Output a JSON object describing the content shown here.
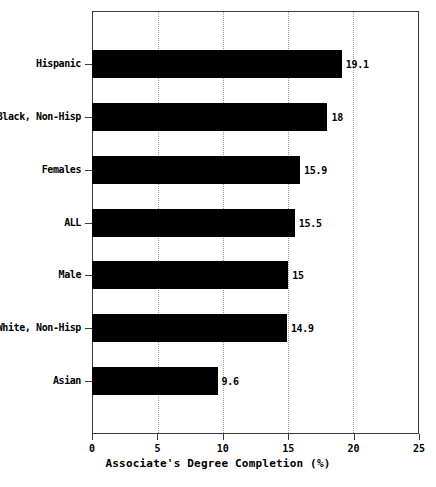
{
  "chart_data": {
    "type": "bar",
    "orientation": "horizontal",
    "title": "",
    "xlabel": "Associate's Degree Completion (%)",
    "ylabel": "",
    "xlim": [
      0,
      25
    ],
    "xticks": [
      0,
      5,
      10,
      15,
      20,
      25
    ],
    "xtick_labels": [
      "0",
      "5",
      "10",
      "15",
      "20",
      "25"
    ],
    "grid": "vertical-dotted",
    "legend": "none",
    "bar_color": "#000000",
    "categories": [
      "Hispanic",
      "Black, Non-Hisp",
      "Females",
      "ALL",
      "Male",
      "White, Non-Hisp",
      "Asian"
    ],
    "values": [
      19.1,
      18,
      15.9,
      15.5,
      15,
      14.9,
      9.6
    ],
    "value_labels": [
      "19.1",
      "18",
      "15.9",
      "15.5",
      "15",
      "14.9",
      "9.6"
    ]
  }
}
